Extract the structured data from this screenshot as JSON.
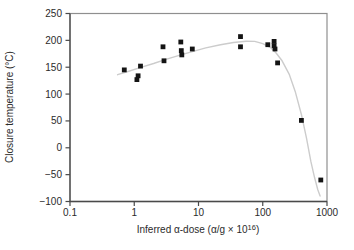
{
  "figure": {
    "ylabel": "Closure temperature (°C)",
    "xlabel_main": "Inferred α-dose (α/g × 10",
    "xlabel_sup": "16",
    "xlabel_close": ")"
  },
  "colors": {
    "marker": "#141414",
    "trend_curve": "#cccccc",
    "frame_light": "#8f8f8f",
    "frame_dark": "#4a4a4a",
    "text": "#2b2b2b",
    "background": "#ffffff"
  },
  "chart_data": {
    "type": "scatter",
    "title": "",
    "xlabel": "Inferred α-dose (α/g × 10^16)",
    "ylabel": "Closure temperature (°C)",
    "x_scale": "log",
    "y_scale": "linear",
    "xlim": [
      0.1,
      1000
    ],
    "ylim": [
      -100,
      250
    ],
    "x_ticks": [
      0.1,
      1,
      10,
      100,
      1000
    ],
    "x_tick_labels": [
      "0.1",
      "1",
      "10",
      "100",
      "1000"
    ],
    "y_ticks": [
      250,
      200,
      150,
      100,
      50,
      0,
      -50,
      -100
    ],
    "y_tick_labels": [
      "250",
      "200",
      "150",
      "100",
      "50",
      "0",
      "−50",
      "−100"
    ],
    "grid": false,
    "legend": false,
    "series": [
      {
        "name": "closure-temperature-samples",
        "kind": "scatter",
        "marker": "square",
        "color": "#141414",
        "points": [
          [
            0.7,
            145
          ],
          [
            1.1,
            127
          ],
          [
            1.15,
            134
          ],
          [
            1.25,
            152
          ],
          [
            2.8,
            188
          ],
          [
            2.9,
            162
          ],
          [
            5.3,
            197
          ],
          [
            5.4,
            181
          ],
          [
            5.5,
            173
          ],
          [
            8,
            184
          ],
          [
            45,
            207
          ],
          [
            45,
            188
          ],
          [
            120,
            192
          ],
          [
            150,
            198
          ],
          [
            150,
            190
          ],
          [
            155,
            184
          ],
          [
            170,
            158
          ],
          [
            400,
            51
          ],
          [
            800,
            -60
          ]
        ]
      },
      {
        "name": "fitted-trend-curve",
        "kind": "line",
        "marker": "none",
        "color": "#cccccc",
        "points": [
          [
            0.55,
            136
          ],
          [
            0.8,
            142
          ],
          [
            1.2,
            149
          ],
          [
            2.0,
            157
          ],
          [
            3.2,
            165
          ],
          [
            5.0,
            172
          ],
          [
            8.0,
            179
          ],
          [
            13,
            186
          ],
          [
            22,
            192
          ],
          [
            35,
            196
          ],
          [
            55,
            198.5
          ],
          [
            75,
            198
          ],
          [
            100,
            194
          ],
          [
            130,
            187
          ],
          [
            160,
            177
          ],
          [
            200,
            162
          ],
          [
            260,
            136
          ],
          [
            320,
            105
          ],
          [
            400,
            62
          ],
          [
            480,
            18
          ],
          [
            560,
            -25
          ],
          [
            640,
            -55
          ],
          [
            720,
            -78
          ],
          [
            780,
            -90
          ]
        ]
      }
    ]
  }
}
